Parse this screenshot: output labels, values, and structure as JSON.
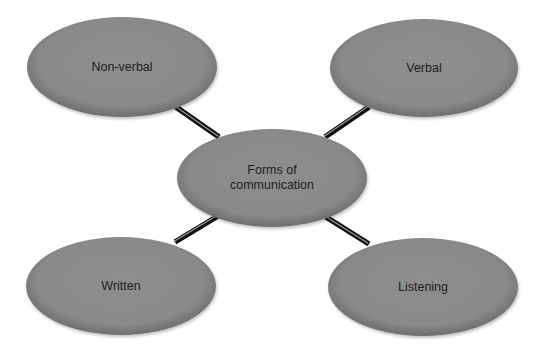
{
  "diagram": {
    "type": "mind-map",
    "colors": {
      "node_fill": "#8b8b8b",
      "node_edge": "#707070",
      "connector": "#111111",
      "connector_highlight": "#9a9a9a",
      "text": "#1e1e1e",
      "background": "#ffffff"
    },
    "center": {
      "id": "forms",
      "label": "Forms of\ncommunication",
      "cx": 272,
      "cy": 178,
      "rx": 95,
      "ry": 49
    },
    "nodes": [
      {
        "id": "non-verbal",
        "label": "Non-verbal",
        "cx": 122,
        "cy": 67,
        "rx": 95,
        "ry": 50,
        "line": {
          "x1": 176,
          "y1": 107,
          "x2": 219,
          "y2": 137
        }
      },
      {
        "id": "verbal",
        "label": "Verbal",
        "cx": 424,
        "cy": 68,
        "rx": 94,
        "ry": 49,
        "line": {
          "x1": 369,
          "y1": 107,
          "x2": 325,
          "y2": 137
        }
      },
      {
        "id": "written",
        "label": "Written",
        "cx": 121,
        "cy": 286,
        "rx": 95,
        "ry": 49,
        "line": {
          "x1": 175,
          "y1": 242,
          "x2": 218,
          "y2": 216
        }
      },
      {
        "id": "listening",
        "label": "Listening",
        "cx": 423,
        "cy": 287,
        "rx": 95,
        "ry": 49,
        "line": {
          "x1": 369,
          "y1": 244,
          "x2": 326,
          "y2": 217
        }
      }
    ]
  }
}
